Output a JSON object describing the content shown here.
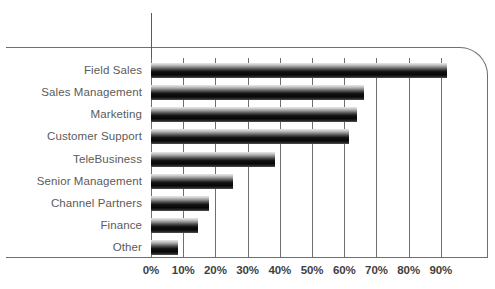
{
  "top_sliver_text": "",
  "chart_data": {
    "type": "bar",
    "orientation": "horizontal",
    "title": "",
    "subtitle": "",
    "xlabel": "",
    "ylabel": "",
    "categories": [
      "Field Sales",
      "Sales Management",
      "Marketing",
      "Customer Support",
      "TeleBusiness",
      "Senior Management",
      "Channel Partners",
      "Finance",
      "Other"
    ],
    "values": [
      92,
      66,
      64,
      61.5,
      38.5,
      25.5,
      18,
      14.5,
      8.5
    ],
    "value_suffix": "%",
    "xlim": [
      0,
      95
    ],
    "xticks": [
      0,
      10,
      20,
      30,
      40,
      50,
      60,
      70,
      80,
      90
    ],
    "xtick_labels": [
      "0%",
      "10%",
      "20%",
      "30%",
      "40%",
      "50%",
      "60%",
      "70%",
      "80%",
      "90%"
    ],
    "grid": "vertical",
    "legend": "none",
    "bar_style": "vertical-gradient-gray-to-black",
    "colors": {
      "bar_top": "#e8e8e8",
      "bar_core": "#0a0a0a",
      "gridline": "#6f6f6f",
      "frame": "#6f6f6f",
      "axis": "#5a5a5a",
      "category_label": "#5b5b5b",
      "tick_label": "#3f3f3f",
      "background": "#ffffff"
    }
  }
}
